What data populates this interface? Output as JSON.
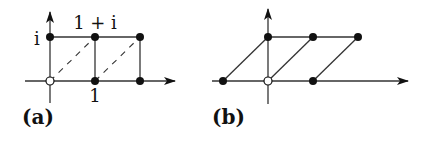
{
  "panels": [
    {
      "id": "a",
      "caption": "(a)",
      "labels": {
        "i": "i",
        "one_plus_i": "1 + i",
        "one": "1"
      },
      "description": "Square lattice of Gaussian integers with dashed diagonals",
      "points": [
        {
          "x": 0,
          "y": 0,
          "filled": false
        },
        {
          "x": 1,
          "y": 0,
          "filled": true
        },
        {
          "x": 2,
          "y": 0,
          "filled": true
        },
        {
          "x": 0,
          "y": 1,
          "filled": true
        },
        {
          "x": 1,
          "y": 1,
          "filled": true
        },
        {
          "x": 2,
          "y": 1,
          "filled": true
        }
      ]
    },
    {
      "id": "b",
      "caption": "(b)",
      "description": "Sheared lattice (parallelograms)",
      "points": [
        {
          "x": -1,
          "y": 0,
          "filled": true
        },
        {
          "x": 0,
          "y": 0,
          "filled": false
        },
        {
          "x": 1,
          "y": 0,
          "filled": true
        },
        {
          "x": 0,
          "y": 1,
          "filled": true
        },
        {
          "x": 1,
          "y": 1,
          "filled": true
        },
        {
          "x": 2,
          "y": 1,
          "filled": true
        }
      ]
    }
  ]
}
